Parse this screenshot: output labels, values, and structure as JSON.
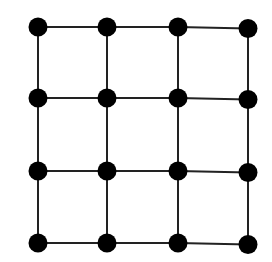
{
  "diagram": {
    "type": "grid-graph",
    "rows": 4,
    "cols": 4,
    "node_count": 16,
    "edge_count": 24,
    "colors": {
      "background": "#ffffff",
      "node": "#000000",
      "edge": "#222222"
    },
    "node_radius": 9.5,
    "edge_width": 2,
    "col_x": [
      38,
      107,
      178,
      248
    ],
    "row_y": [
      27,
      98,
      171,
      243
    ]
  }
}
